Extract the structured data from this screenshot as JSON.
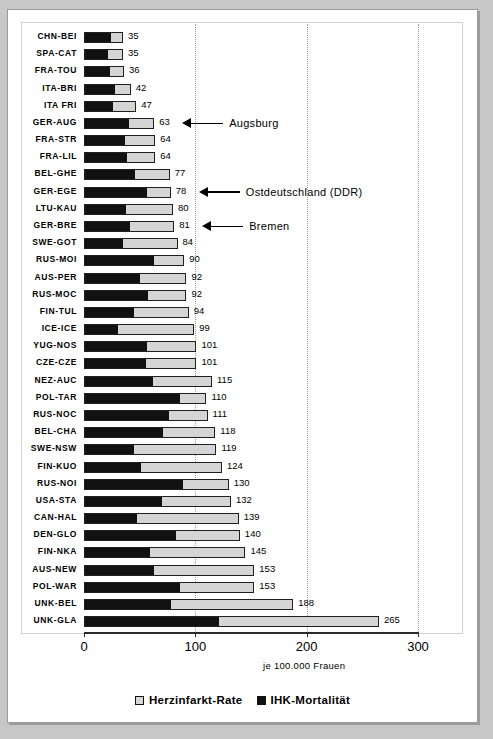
{
  "chart_data": {
    "type": "bar",
    "orientation": "horizontal",
    "stacked": true,
    "title": "",
    "xlabel": "je 100.000 Frauen",
    "ylabel": "",
    "xlim": [
      0,
      300
    ],
    "xticks": [
      0,
      100,
      200,
      300
    ],
    "xticklabels": [
      "0",
      "100",
      "200",
      "300"
    ],
    "grid": "vertical-dotted",
    "legend_position": "bottom-center",
    "legend": [
      {
        "label": "Herzinfarkt-Rate",
        "color": "#d5d5d5",
        "swatch": "light"
      },
      {
        "label": "IHK-Mortalität",
        "color": "#111111",
        "swatch": "dark"
      }
    ],
    "series": [
      {
        "name": "IHK-Mortalität",
        "key": "dark"
      },
      {
        "name": "Herzinfarkt-Rate",
        "key": "total"
      }
    ],
    "categories": [
      "CHN-BEI",
      "SPA-CAT",
      "FRA-TOU",
      "ITA-BRI",
      "ITA FRI",
      "GER-AUG",
      "FRA-STR",
      "FRA-LIL",
      "BEL-GHE",
      "GER-EGE",
      "LTU-KAU",
      "GER-BRE",
      "SWE-GOT",
      "RUS-MOI",
      "AUS-PER",
      "RUS-MOC",
      "FIN-TUL",
      "ICE-ICE",
      "YUG-NOS",
      "CZE-CZE",
      "NEZ-AUC",
      "POL-TAR",
      "RUS-NOC",
      "BEL-CHA",
      "SWE-NSW",
      "FIN-KUO",
      "RUS-NOI",
      "USA-STA",
      "CAN-HAL",
      "DEN-GLO",
      "FIN-NKA",
      "AUS-NEW",
      "POL-WAR",
      "UNK-BEL",
      "UNK-GLA"
    ],
    "values": [
      35,
      35,
      36,
      42,
      47,
      63,
      64,
      64,
      77,
      78,
      80,
      81,
      84,
      90,
      92,
      92,
      94,
      99,
      101,
      101,
      115,
      110,
      111,
      118,
      119,
      124,
      130,
      132,
      139,
      140,
      145,
      153,
      153,
      188,
      265
    ],
    "dark_values": [
      25,
      22,
      24,
      28,
      26,
      41,
      37,
      39,
      46,
      57,
      38,
      41,
      35,
      63,
      50,
      58,
      45,
      30,
      57,
      56,
      62,
      87,
      77,
      71,
      45,
      51,
      89,
      70,
      47,
      83,
      59,
      63,
      86,
      78,
      121
    ],
    "rows": [
      {
        "category": "CHN-BEI",
        "value": 35,
        "dark": 25,
        "label": "35"
      },
      {
        "category": "SPA-CAT",
        "value": 35,
        "dark": 22,
        "label": "35"
      },
      {
        "category": "FRA-TOU",
        "value": 36,
        "dark": 24,
        "label": "36"
      },
      {
        "category": "ITA-BRI",
        "value": 42,
        "dark": 28,
        "label": "42"
      },
      {
        "category": "ITA FRI",
        "value": 47,
        "dark": 26,
        "label": "47"
      },
      {
        "category": "GER-AUG",
        "value": 63,
        "dark": 41,
        "label": "63"
      },
      {
        "category": "FRA-STR",
        "value": 64,
        "dark": 37,
        "label": "64"
      },
      {
        "category": "FRA-LIL",
        "value": 64,
        "dark": 39,
        "label": "64"
      },
      {
        "category": "BEL-GHE",
        "value": 77,
        "dark": 46,
        "label": "77"
      },
      {
        "category": "GER-EGE",
        "value": 78,
        "dark": 57,
        "label": "78"
      },
      {
        "category": "LTU-KAU",
        "value": 80,
        "dark": 38,
        "label": "80"
      },
      {
        "category": "GER-BRE",
        "value": 81,
        "dark": 41,
        "label": "81"
      },
      {
        "category": "SWE-GOT",
        "value": 84,
        "dark": 35,
        "label": "84"
      },
      {
        "category": "RUS-MOI",
        "value": 90,
        "dark": 63,
        "label": "90"
      },
      {
        "category": "AUS-PER",
        "value": 92,
        "dark": 50,
        "label": "92"
      },
      {
        "category": "RUS-MOC",
        "value": 92,
        "dark": 58,
        "label": "92"
      },
      {
        "category": "FIN-TUL",
        "value": 94,
        "dark": 45,
        "label": "94"
      },
      {
        "category": "ICE-ICE",
        "value": 99,
        "dark": 30,
        "label": "99"
      },
      {
        "category": "YUG-NOS",
        "value": 101,
        "dark": 57,
        "label": "101"
      },
      {
        "category": "CZE-CZE",
        "value": 101,
        "dark": 56,
        "label": "101"
      },
      {
        "category": "NEZ-AUC",
        "value": 115,
        "dark": 62,
        "label": "115"
      },
      {
        "category": "POL-TAR",
        "value": 110,
        "dark": 87,
        "label": "110"
      },
      {
        "category": "RUS-NOC",
        "value": 111,
        "dark": 77,
        "label": "111"
      },
      {
        "category": "BEL-CHA",
        "value": 118,
        "dark": 71,
        "label": "118"
      },
      {
        "category": "SWE-NSW",
        "value": 119,
        "dark": 45,
        "label": "119"
      },
      {
        "category": "FIN-KUO",
        "value": 124,
        "dark": 51,
        "label": "124"
      },
      {
        "category": "RUS-NOI",
        "value": 130,
        "dark": 89,
        "label": "130"
      },
      {
        "category": "USA-STA",
        "value": 132,
        "dark": 70,
        "label": "132"
      },
      {
        "category": "CAN-HAL",
        "value": 139,
        "dark": 47,
        "label": "139"
      },
      {
        "category": "DEN-GLO",
        "value": 140,
        "dark": 83,
        "label": "140"
      },
      {
        "category": "FIN-NKA",
        "value": 145,
        "dark": 59,
        "label": "145"
      },
      {
        "category": "AUS-NEW",
        "value": 153,
        "dark": 63,
        "label": "153"
      },
      {
        "category": "POL-WAR",
        "value": 153,
        "dark": 86,
        "label": "153"
      },
      {
        "category": "UNK-BEL",
        "value": 188,
        "dark": 78,
        "label": "188"
      },
      {
        "category": "UNK-GLA",
        "value": 265,
        "dark": 121,
        "label": "265"
      }
    ],
    "annotations": [
      {
        "text": "Augsburg",
        "category": "GER-AUG",
        "row_index": 5
      },
      {
        "text": "Ostdeutschland (DDR)",
        "category": "GER-EGE",
        "row_index": 9
      },
      {
        "text": "Bremen",
        "category": "GER-BRE",
        "row_index": 11
      }
    ]
  },
  "colors": {
    "bar_light": "#d5d5d5",
    "bar_dark": "#111111",
    "bar_outline": "#202020",
    "page_background": "#c7c7c7",
    "card_background": "#ffffff",
    "gridline": "#9d9d9d",
    "axis": "#2b2b2b"
  }
}
